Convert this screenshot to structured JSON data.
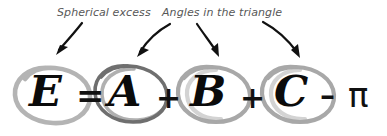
{
  "figure": {
    "background_color": "#ffffff"
  },
  "annotations": {
    "labels": [
      {
        "id": "spherical-excess",
        "text": "Spherical excess",
        "color": "#575757",
        "points_to": [
          "E"
        ]
      },
      {
        "id": "angles-in-the-triangle",
        "text": "Angles in the triangle",
        "color": "#575757",
        "points_to": [
          "A",
          "B",
          "C"
        ]
      }
    ],
    "arrow_color": "#111111",
    "arrow_count": 4
  },
  "equation": {
    "expression": "E = A + B + C - π",
    "text_color": "#0b0b0b",
    "tokens": [
      {
        "id": "E",
        "kind": "term",
        "text": "E",
        "circled": true,
        "circle_color": "#b4b4b4"
      },
      {
        "id": "eq",
        "kind": "operator",
        "text": "=",
        "circled": false,
        "circle_color": null
      },
      {
        "id": "A",
        "kind": "term",
        "text": "A",
        "circled": true,
        "circle_color": "#6f6f6f"
      },
      {
        "id": "plus1",
        "kind": "operator",
        "text": "+",
        "circled": false,
        "circle_color": null
      },
      {
        "id": "B",
        "kind": "term",
        "text": "B",
        "circled": true,
        "circle_color": "#a8a8a8"
      },
      {
        "id": "plus2",
        "kind": "operator",
        "text": "+",
        "circled": false,
        "circle_color": null
      },
      {
        "id": "C",
        "kind": "term",
        "text": "C",
        "circled": true,
        "circle_color": "#a8a8a8"
      },
      {
        "id": "minus",
        "kind": "operator",
        "text": "–",
        "circled": false,
        "circle_color": null
      },
      {
        "id": "pi",
        "kind": "constant",
        "text": "π",
        "circled": false,
        "circle_color": null
      }
    ]
  }
}
